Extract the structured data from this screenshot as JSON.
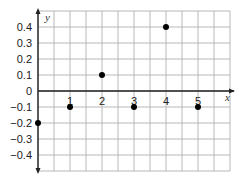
{
  "chart_data": {
    "type": "scatter",
    "title": "",
    "xlabel": "x",
    "ylabel": "y",
    "x": [
      0,
      1,
      2,
      3,
      4,
      5
    ],
    "y": [
      -0.2,
      -0.1,
      0.1,
      -0.1,
      0.4,
      -0.1
    ],
    "xlim": [
      0,
      6
    ],
    "ylim": [
      -0.5,
      0.5
    ],
    "x_ticks": [
      "1",
      "2",
      "3",
      "4",
      "5"
    ],
    "y_ticks": [
      "0.4",
      "0.3",
      "0.2",
      "0.1",
      "0",
      "-0.1",
      "-0.2",
      "-0.3",
      "-0.4"
    ],
    "grid": true,
    "legend": null,
    "colors": {
      "grid": "#b8b8b8",
      "axis": "#222222",
      "point": "#000000"
    }
  }
}
